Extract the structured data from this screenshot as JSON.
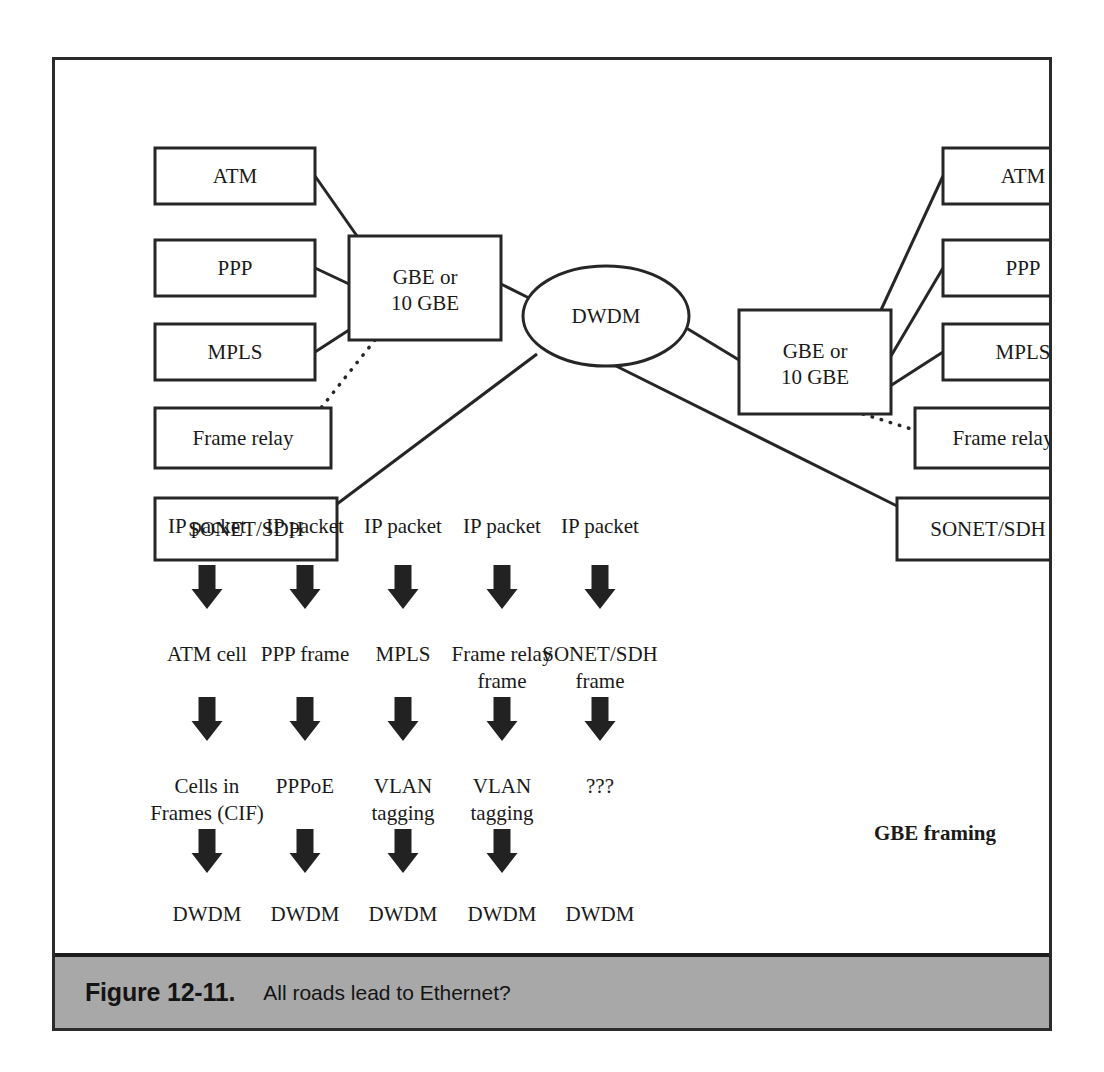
{
  "figure": {
    "caption_number": "Figure 12-11.",
    "caption_text": "All roads lead to Ethernet?"
  },
  "colors": {
    "frame_border": "#2b2b2b",
    "caption_background": "#a8a8a8",
    "stroke": "#262626",
    "text": "#1a1a1a",
    "arrow_fill": "#222222",
    "page_background": "#ffffff"
  },
  "network_diagram": {
    "left_group": {
      "protocols": [
        {
          "label": "ATM",
          "x": 100,
          "y": 88,
          "w": 160,
          "h": 56,
          "link": "solid"
        },
        {
          "label": "PPP",
          "x": 100,
          "y": 180,
          "w": 160,
          "h": 56,
          "link": "solid"
        },
        {
          "label": "MPLS",
          "x": 100,
          "y": 264,
          "w": 160,
          "h": 56,
          "link": "solid"
        },
        {
          "label": "Frame relay",
          "x": 100,
          "y": 348,
          "w": 176,
          "h": 60,
          "link": "dotted"
        },
        {
          "label": "SONET/SDH",
          "x": 100,
          "y": 438,
          "w": 182,
          "h": 62,
          "link": "solid"
        }
      ],
      "aggregator": {
        "label_line1": "GBE or",
        "label_line2": "10 GBE",
        "x": 294,
        "y": 176,
        "w": 152,
        "h": 104
      }
    },
    "center": {
      "label": "DWDM",
      "cx": 551,
      "cy": 256,
      "rx": 83,
      "ry": 50
    },
    "right_group": {
      "aggregator": {
        "label_line1": "GBE or",
        "label_line2": "10 GBE",
        "x": 684,
        "y": 250,
        "w": 152,
        "h": 104
      },
      "protocols": [
        {
          "label": "ATM",
          "x": 888,
          "y": 88,
          "w": 160,
          "h": 56,
          "link": "solid"
        },
        {
          "label": "PPP",
          "x": 888,
          "y": 180,
          "w": 160,
          "h": 56,
          "link": "solid"
        },
        {
          "label": "MPLS",
          "x": 888,
          "y": 264,
          "w": 160,
          "h": 56,
          "link": "solid"
        },
        {
          "label": "Frame relay",
          "x": 860,
          "y": 348,
          "w": 176,
          "h": 60,
          "link": "dotted"
        },
        {
          "label": "SONET/SDH",
          "x": 842,
          "y": 438,
          "w": 182,
          "h": 62,
          "link": "solid"
        }
      ]
    }
  },
  "flow_chart": {
    "columns": [
      {
        "id": "atm-column",
        "center_x": 152,
        "steps": [
          "IP packet",
          "ATM cell",
          "Cells in\nFrames (CIF)",
          "DWDM"
        ],
        "arrows": 3
      },
      {
        "id": "ppp-column",
        "center_x": 250,
        "steps": [
          "IP packet",
          "PPP frame",
          "PPPoE",
          "DWDM"
        ],
        "arrows": 3
      },
      {
        "id": "mpls-column",
        "center_x": 348,
        "steps": [
          "IP packet",
          "MPLS",
          "VLAN\ntagging",
          "DWDM"
        ],
        "arrows": 3
      },
      {
        "id": "frame-relay-column",
        "center_x": 447,
        "steps": [
          "IP packet",
          "Frame relay\nframe",
          "VLAN\ntagging",
          "DWDM"
        ],
        "arrows": 3
      },
      {
        "id": "sonet-sdh-column",
        "center_x": 545,
        "steps": [
          "IP packet",
          "SONET/SDH\nframe",
          "???",
          "DWDM"
        ],
        "arrows": 2
      }
    ],
    "annotation": {
      "label": "GBE framing",
      "x": 880,
      "y": 780
    }
  }
}
